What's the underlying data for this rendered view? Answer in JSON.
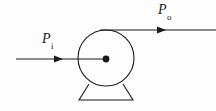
{
  "figure": {
    "kind": "engineering-schematic",
    "background_color": "#fdfdfd",
    "ink_color": "#1a1a1a",
    "width": 216,
    "height": 111,
    "labels": {
      "input_power": {
        "base": "P",
        "subscript": "i"
      },
      "output_power": {
        "base": "P",
        "subscript": "o"
      }
    },
    "machine": {
      "body_shape": "circle",
      "center_x": 106,
      "center_y": 58,
      "radius": 28,
      "shaft_dot_radius": 3.4,
      "base_shape": "trapezoid",
      "base_top_left_x": 89,
      "base_top_right_x": 123,
      "base_top_y": 84,
      "base_bottom_left_x": 79,
      "base_bottom_right_x": 133,
      "base_bottom_y": 100
    },
    "arrows": {
      "input": {
        "x_start": 16,
        "x_end": 106,
        "y": 59,
        "head_x": 61,
        "direction": "right"
      },
      "output": {
        "x_start": 100,
        "x_end": 216,
        "y": 30,
        "head_x": 165,
        "direction": "right"
      }
    }
  }
}
